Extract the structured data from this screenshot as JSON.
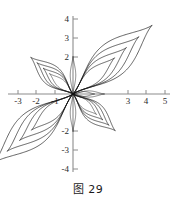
{
  "figure": {
    "caption": "图 29",
    "caption_label": "图",
    "caption_number": "29"
  },
  "chart_data": {
    "type": "line",
    "title": "图 29",
    "xlabel": "",
    "ylabel": "",
    "xlim": [
      -3.6,
      5.4
    ],
    "ylim": [
      -4.4,
      4.4
    ],
    "grid": false,
    "legend": null,
    "x_ticks": [
      -3,
      -2,
      -1,
      3,
      4,
      5
    ],
    "x_tick_labels": [
      "-3",
      "-2",
      "-1",
      "3",
      "4",
      "5"
    ],
    "y_ticks": [
      4,
      3,
      2,
      -2,
      -3,
      -4
    ],
    "y_tick_labels": [
      "4",
      "3",
      "2",
      "-2",
      "-3",
      "-4"
    ],
    "axis_color": "#8c8c8c",
    "curve_color": "#111111",
    "series": [
      {
        "name": "petal-upper-right-outer",
        "angle_deg": 41,
        "length": 5.7,
        "width": 1.85,
        "tip": [
          4.3,
          3.75
        ]
      },
      {
        "name": "petal-upper-right-mid",
        "angle_deg": 41,
        "length": 4.75,
        "width": 1.45,
        "tip": [
          3.6,
          3.15
        ]
      },
      {
        "name": "petal-upper-right-inner",
        "angle_deg": 41,
        "length": 3.85,
        "width": 1.1,
        "tip": [
          2.9,
          2.55
        ]
      },
      {
        "name": "petal-upper-right-core",
        "angle_deg": 41,
        "length": 3.0,
        "width": 0.78,
        "tip": [
          2.25,
          1.95
        ]
      },
      {
        "name": "petal-lower-left-outer",
        "angle_deg": 221,
        "length": 5.7,
        "width": 1.85,
        "tip": [
          -4.3,
          -3.75
        ]
      },
      {
        "name": "petal-lower-left-mid",
        "angle_deg": 221,
        "length": 4.75,
        "width": 1.45,
        "tip": [
          -3.6,
          -3.15
        ]
      },
      {
        "name": "petal-lower-left-inner",
        "angle_deg": 221,
        "length": 3.85,
        "width": 1.1,
        "tip": [
          -2.9,
          -2.55
        ]
      },
      {
        "name": "petal-lower-left-core",
        "angle_deg": 221,
        "length": 3.0,
        "width": 0.78,
        "tip": [
          -2.25,
          -1.95
        ]
      },
      {
        "name": "petal-upper-left-outer",
        "angle_deg": 139,
        "length": 3.05,
        "width": 1.08,
        "tip": [
          -2.3,
          2.0
        ]
      },
      {
        "name": "petal-upper-left-mid",
        "angle_deg": 139,
        "length": 2.6,
        "width": 0.86,
        "tip": [
          -1.95,
          1.7
        ]
      },
      {
        "name": "petal-upper-left-inner",
        "angle_deg": 139,
        "length": 2.15,
        "width": 0.66,
        "tip": [
          -1.6,
          1.4
        ]
      },
      {
        "name": "petal-upper-left-core",
        "angle_deg": 139,
        "length": 1.7,
        "width": 0.46,
        "tip": [
          -1.28,
          1.12
        ]
      },
      {
        "name": "petal-lower-right-outer",
        "angle_deg": 319,
        "length": 3.05,
        "width": 1.08,
        "tip": [
          2.3,
          -2.0
        ]
      },
      {
        "name": "petal-lower-right-mid",
        "angle_deg": 319,
        "length": 2.6,
        "width": 0.86,
        "tip": [
          1.95,
          -1.7
        ]
      },
      {
        "name": "petal-lower-right-inner",
        "angle_deg": 319,
        "length": 2.15,
        "width": 0.66,
        "tip": [
          1.6,
          -1.4
        ]
      },
      {
        "name": "petal-lower-right-core",
        "angle_deg": 319,
        "length": 1.7,
        "width": 0.46,
        "tip": [
          1.28,
          -1.12
        ]
      },
      {
        "name": "petal-up-vertical",
        "angle_deg": 90,
        "length": 2.05,
        "width": 0.3,
        "tip": [
          0,
          2.05
        ]
      },
      {
        "name": "petal-down-vertical",
        "angle_deg": 270,
        "length": 2.05,
        "width": 0.3,
        "tip": [
          0,
          -2.05
        ]
      },
      {
        "name": "loop-right-small-outer",
        "angle_deg": 0,
        "length": 1.72,
        "width": 0.34,
        "tip": [
          1.72,
          0
        ]
      },
      {
        "name": "loop-right-small-inner",
        "angle_deg": 0,
        "length": 1.18,
        "width": 0.26,
        "tip": [
          1.18,
          0
        ]
      }
    ]
  }
}
